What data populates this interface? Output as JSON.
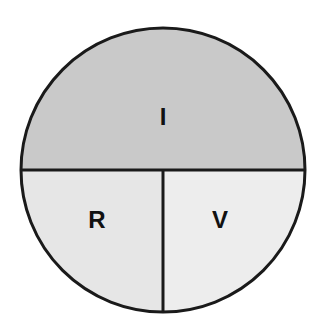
{
  "figure": {
    "type": "divided-circle-diagram",
    "background_color": "#ffffff",
    "outline_color": "#1a1a1a",
    "outline_width": 3,
    "divider_color": "#1a1a1a",
    "divider_width": 3
  },
  "circle": {
    "center_x": 163,
    "center_y": 170,
    "radius": 142,
    "diameter": 284,
    "bounds": {
      "left": 21,
      "top": 28,
      "right": 305,
      "bottom": 312
    }
  },
  "dividers": {
    "horizontal": {
      "name": "horizontal-diameter",
      "y": 170,
      "x_start": 21,
      "x_end": 305
    },
    "vertical": {
      "name": "vertical-radius",
      "x": 163,
      "y_start": 170,
      "y_end": 312
    }
  },
  "regions": [
    {
      "id": "region-i",
      "label": "I",
      "position": "top-half",
      "fill_color": "#c9c9c9",
      "label_x": 163,
      "label_y": 118,
      "label_font_size": 24,
      "share_of_circle": 0.5
    },
    {
      "id": "region-r",
      "label": "R",
      "position": "bottom-left-quadrant",
      "fill_color": "#e6e6e6",
      "label_x": 97,
      "label_y": 221,
      "label_font_size": 24,
      "share_of_circle": 0.25
    },
    {
      "id": "region-v",
      "label": "V",
      "position": "bottom-right-quadrant",
      "fill_color": "#ededed",
      "label_x": 220,
      "label_y": 221,
      "label_font_size": 24,
      "share_of_circle": 0.25
    }
  ],
  "chart_data": {
    "type": "pie",
    "title": "",
    "subtitle": "",
    "xlabel": "",
    "ylabel": "",
    "legend_position": "none",
    "grid": false,
    "categories": [
      "I",
      "R",
      "V"
    ],
    "values": [
      50,
      25,
      25
    ],
    "value_unit": "percent",
    "colors": [
      "#c9c9c9",
      "#e6e6e6",
      "#ededed"
    ],
    "annotations": [
      "I",
      "R",
      "V"
    ]
  }
}
